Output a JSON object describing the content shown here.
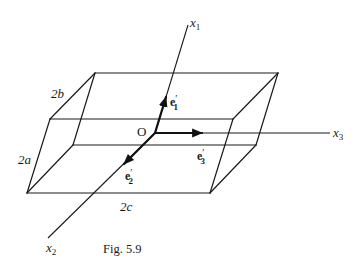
{
  "figure": {
    "caption": "Fig. 5.9",
    "origin_label": "O",
    "axes": [
      {
        "id": "x1",
        "base": "x",
        "sub": "1"
      },
      {
        "id": "x2",
        "base": "x",
        "sub": "2"
      },
      {
        "id": "x3",
        "base": "x",
        "sub": "3"
      }
    ],
    "vectors": [
      {
        "id": "e1",
        "base": "e",
        "prime": "′",
        "sub": "1"
      },
      {
        "id": "e2",
        "base": "e",
        "prime": "′",
        "sub": "2"
      },
      {
        "id": "e3",
        "base": "e",
        "prime": "′",
        "sub": "3"
      }
    ],
    "dimensions": {
      "depth": "2b",
      "height": "2a",
      "width": "2c"
    },
    "colors": {
      "line": "#1a1a1a",
      "background": "#ffffff"
    }
  }
}
